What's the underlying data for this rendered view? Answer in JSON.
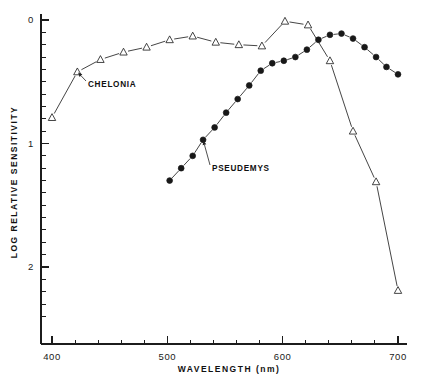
{
  "figure": {
    "background_color": "#ffffff",
    "ink_color": "#1c1c1c"
  },
  "chart_data": {
    "type": "line",
    "title": "",
    "subtitle": "",
    "xlabel": "WAVELENGTH (nm)",
    "ylabel": "LOG RELATIVE SENSITIVITY",
    "xlim": [
      400,
      700
    ],
    "ylim": [
      0,
      2.45
    ],
    "y_inverted": true,
    "grid": false,
    "legend_position": "inline-annotations",
    "x_ticks_major": [
      400,
      500,
      600,
      700
    ],
    "x_tick_labels": [
      "400",
      "500",
      "600",
      "700"
    ],
    "x_tick_minor_step": 20,
    "y_ticks_major": [
      0,
      1,
      2
    ],
    "y_tick_labels": [
      "0",
      "1",
      "2"
    ],
    "y_tick_minor_step": 0.1,
    "series": [
      {
        "name": "CHELONIA",
        "marker": "open-triangle",
        "x": [
          400,
          422,
          442,
          462,
          482,
          502,
          522,
          542,
          562,
          582,
          602,
          622,
          641,
          661,
          681,
          700
        ],
        "values": [
          0.79,
          0.42,
          0.32,
          0.26,
          0.22,
          0.16,
          0.13,
          0.18,
          0.2,
          0.21,
          0.01,
          0.04,
          0.33,
          0.9,
          1.31,
          2.19
        ]
      },
      {
        "name": "PSEUDEMYS",
        "marker": "filled-circle",
        "x": [
          502,
          512,
          522,
          531,
          541,
          551,
          561,
          571,
          581,
          591,
          601,
          611,
          621,
          631,
          641,
          651,
          661,
          671,
          681,
          690,
          700
        ],
        "values": [
          1.3,
          1.2,
          1.1,
          0.97,
          0.87,
          0.75,
          0.64,
          0.53,
          0.41,
          0.35,
          0.33,
          0.3,
          0.24,
          0.16,
          0.12,
          0.11,
          0.15,
          0.22,
          0.3,
          0.38,
          0.44
        ]
      }
    ],
    "annotations": [
      {
        "text": "CHELONIA",
        "label_x": 88,
        "label_y": 87,
        "target_series": "CHELONIA",
        "target_x": 422,
        "target_y": 0.42
      },
      {
        "text": "PSEUDEMYS",
        "label_x": 212,
        "label_y": 171,
        "target_series": "PSEUDEMYS",
        "target_x": 531,
        "target_y": 0.97
      }
    ]
  }
}
